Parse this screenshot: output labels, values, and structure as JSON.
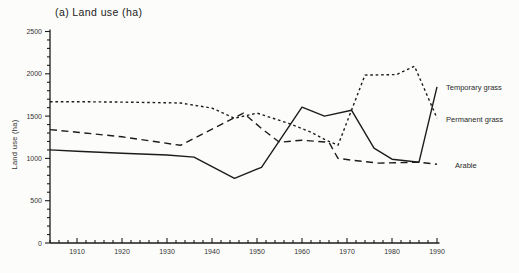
{
  "figure": {
    "title": "(a) Land use (ha)"
  },
  "chart_data": {
    "type": "line",
    "title": "(a) Land use (ha)",
    "xlabel": "",
    "ylabel": "Land use (ha)",
    "xlim": [
      1904,
      1990
    ],
    "ylim": [
      0,
      2500
    ],
    "x_ticks": [
      1910,
      1920,
      1930,
      1940,
      1950,
      1960,
      1970,
      1980,
      1990
    ],
    "x_minor_step": 2,
    "y_ticks": [
      0,
      500,
      1000,
      1500,
      2000,
      2500
    ],
    "y_minor_step": 100,
    "grid": false,
    "legend_position": "labels-at-line-ends-right",
    "line_color": "#1c1c1c",
    "series": [
      {
        "name": "Temporary grass",
        "style": "solid",
        "points": [
          [
            1904,
            1100
          ],
          [
            1910,
            1085
          ],
          [
            1920,
            1061
          ],
          [
            1930,
            1040
          ],
          [
            1936,
            1015
          ],
          [
            1945,
            765
          ],
          [
            1951,
            895
          ],
          [
            1960,
            1605
          ],
          [
            1965,
            1500
          ],
          [
            1971,
            1570
          ],
          [
            1976,
            1120
          ],
          [
            1980,
            990
          ],
          [
            1986,
            955
          ],
          [
            1990,
            1845
          ]
        ]
      },
      {
        "name": "Permanent grass",
        "style": "dotted",
        "points": [
          [
            1904,
            1670
          ],
          [
            1910,
            1670
          ],
          [
            1920,
            1665
          ],
          [
            1933,
            1655
          ],
          [
            1940,
            1595
          ],
          [
            1945,
            1475
          ],
          [
            1950,
            1535
          ],
          [
            1957,
            1415
          ],
          [
            1962,
            1310
          ],
          [
            1965,
            1225
          ],
          [
            1968,
            1155
          ],
          [
            1971,
            1570
          ],
          [
            1974,
            1985
          ],
          [
            1981,
            1990
          ],
          [
            1985,
            2090
          ],
          [
            1990,
            1475
          ]
        ]
      },
      {
        "name": "Arable",
        "style": "dashed",
        "points": [
          [
            1904,
            1340
          ],
          [
            1910,
            1310
          ],
          [
            1920,
            1255
          ],
          [
            1933,
            1155
          ],
          [
            1947,
            1535
          ],
          [
            1951,
            1355
          ],
          [
            1955,
            1190
          ],
          [
            1960,
            1215
          ],
          [
            1966,
            1190
          ],
          [
            1968,
            1000
          ],
          [
            1971,
            980
          ],
          [
            1977,
            945
          ],
          [
            1986,
            955
          ],
          [
            1990,
            930
          ]
        ]
      }
    ]
  }
}
